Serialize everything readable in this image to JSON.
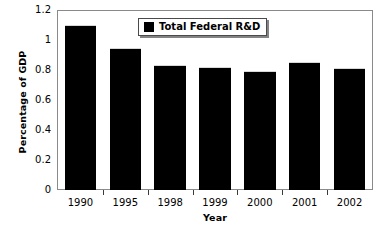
{
  "chart_data": {
    "type": "bar",
    "title": "",
    "subtitle": "",
    "xlabel": "Year",
    "ylabel": "Percentage of GDP",
    "categories": [
      "1990",
      "1995",
      "1998",
      "1999",
      "2000",
      "2001",
      "2002"
    ],
    "series": [
      {
        "name": "Total Federal R&D",
        "color": "#000000",
        "values": [
          1.11,
          0.96,
          0.84,
          0.83,
          0.8,
          0.86,
          0.82
        ]
      }
    ],
    "ylim": [
      0,
      1.2
    ],
    "ytick_values": [
      0,
      0.2,
      0.4,
      0.6,
      0.8,
      1.0,
      1.2
    ],
    "ytick_labels": [
      "0",
      "0.2",
      "0.4",
      "0.6",
      "0.8",
      "1",
      "1.2"
    ],
    "grid": false,
    "legend_position": "top-center",
    "legend_entries": [
      "Total Federal R&D"
    ],
    "annotations": []
  },
  "legend": {
    "entry_label": "Total Federal R&D",
    "swatch_color": "#000000"
  },
  "axes": {
    "y_title": "Percentage of GDP",
    "x_title": "Year"
  }
}
